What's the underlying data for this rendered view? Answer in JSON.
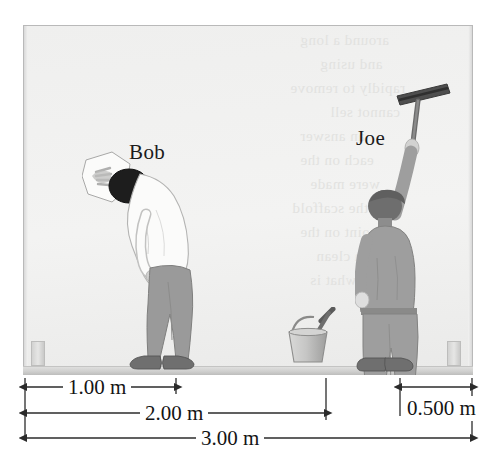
{
  "figure": {
    "scene_description": "Window / wall elevation with two people and a bucket on the ground, with three horizontal dimension measurements below."
  },
  "colors": {
    "background": "#ffffff",
    "wall_fill": "#f1f1f0",
    "frame_line": "#b9b9b9",
    "ground_fill": "#cfcfce",
    "shirt_white": "#fbfbfa",
    "pants_gray": "#9a9a9a",
    "joe_gray": "#9e9e9e",
    "hair_black": "#1d1d1d",
    "hair_dark_gray": "#6e6e6e",
    "shoe_gray": "#6f6f6f",
    "dim_line": "#2b2b2b",
    "text": "#141414",
    "bleed_text": "#e2e2e0"
  },
  "people": [
    {
      "id": "bob",
      "label": "Bob",
      "pose": "bent over, wiping the window with a cloth",
      "shirt": "white",
      "pants": "gray",
      "hair": "black",
      "holding": "cloth-rag"
    },
    {
      "id": "joe",
      "label": "Joe",
      "pose": "standing, right arm raised overhead",
      "shirt": "gray",
      "pants": "gray",
      "hair": "dark gray",
      "holding": "squeegee"
    }
  ],
  "props": [
    {
      "id": "bucket",
      "label": "bucket",
      "contains": "brush-handle"
    },
    {
      "id": "squeegee",
      "label": "squeegee"
    },
    {
      "id": "cloth",
      "label": "cloth"
    }
  ],
  "dimensions": [
    {
      "id": "dim-1",
      "label": "1.00 m",
      "value": 1.0,
      "unit": "m",
      "from_x_px": 25,
      "to_x_px": 176,
      "arrows": "both",
      "row": 0
    },
    {
      "id": "dim-2",
      "label": "2.00 m",
      "value": 2.0,
      "unit": "m",
      "from_x_px": 25,
      "to_x_px": 326,
      "arrows": "both",
      "row": 1
    },
    {
      "id": "dim-3",
      "label": "3.00 m",
      "value": 3.0,
      "unit": "m",
      "from_x_px": 25,
      "to_x_px": 472,
      "arrows": "both",
      "row": 2
    },
    {
      "id": "dim-4",
      "label": "0.500 m",
      "value": 0.5,
      "unit": "m",
      "from_x_px": 400,
      "to_x_px": 472,
      "arrows": "both",
      "row": 0
    }
  ],
  "bleed_text": [
    "around a long",
    "and using",
    "rapidly to remove",
    "cannot sell",
    "an answer",
    "each on the",
    "were made",
    "on the scaffold",
    "point on the",
    "a clean",
    "what is"
  ]
}
